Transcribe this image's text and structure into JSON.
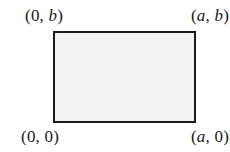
{
  "figure": {
    "type": "geometry-diagram",
    "shape": {
      "name": "rectangle",
      "fill_color": "#f2f2f0",
      "stroke_color": "#1a1a1a",
      "stroke_width": 2
    },
    "background_color": "#ffffff",
    "labels": {
      "top_left": {
        "open": "(",
        "x": "0",
        "x_italic": false,
        "separator": ", ",
        "y": "b",
        "y_italic": true,
        "close": ")",
        "full": "(0, b)"
      },
      "top_right": {
        "open": "(",
        "x": "a",
        "x_italic": true,
        "separator": ", ",
        "y": "b",
        "y_italic": true,
        "close": ")",
        "full": "(a, b)"
      },
      "bottom_left": {
        "open": "(",
        "x": "0",
        "x_italic": false,
        "separator": ", ",
        "y": "0",
        "y_italic": false,
        "close": ")",
        "full": "(0, 0)"
      },
      "bottom_right": {
        "open": "(",
        "x": "a",
        "x_italic": true,
        "separator": ", ",
        "y": "0",
        "y_italic": false,
        "close": ")",
        "full": "(a, 0)"
      }
    }
  }
}
